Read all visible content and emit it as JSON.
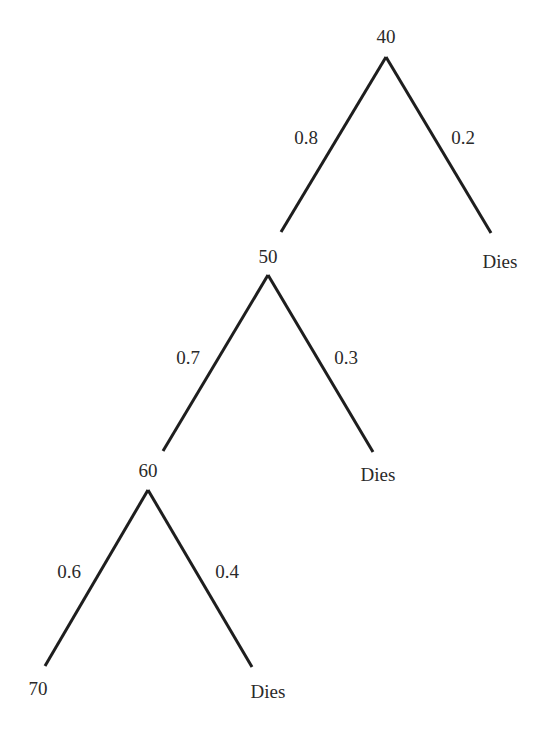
{
  "diagram": {
    "type": "probability-tree",
    "nodes": [
      {
        "id": "n40",
        "label": "40"
      },
      {
        "id": "n50",
        "label": "50"
      },
      {
        "id": "n60",
        "label": "60"
      },
      {
        "id": "n70",
        "label": "70"
      },
      {
        "id": "d1",
        "label": "Dies"
      },
      {
        "id": "d2",
        "label": "Dies"
      },
      {
        "id": "d3",
        "label": "Dies"
      }
    ],
    "edges": [
      {
        "from": "n40",
        "to": "n50",
        "label": "0.8"
      },
      {
        "from": "n40",
        "to": "d1",
        "label": "0.2"
      },
      {
        "from": "n50",
        "to": "n60",
        "label": "0.7"
      },
      {
        "from": "n50",
        "to": "d2",
        "label": "0.3"
      },
      {
        "from": "n60",
        "to": "n70",
        "label": "0.6"
      },
      {
        "from": "n60",
        "to": "d3",
        "label": "0.4"
      }
    ],
    "line_color": "#1e1e1e",
    "text_color": "#2a2a2a"
  }
}
